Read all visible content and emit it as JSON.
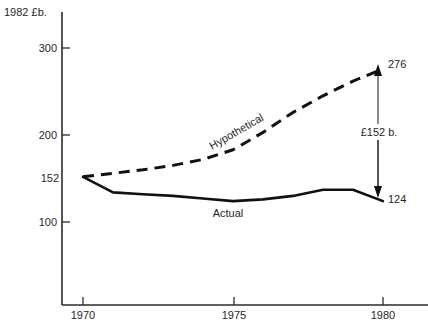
{
  "chart_data": {
    "type": "line",
    "title": "",
    "subtitle": "",
    "xlabel": "",
    "ylabel": "1982 £b.",
    "xlim": [
      1969.3,
      1981.5
    ],
    "ylim": [
      55,
      330
    ],
    "grid": false,
    "legend_position": "inline-annotation",
    "x_ticks": [
      "1970",
      "1975",
      "1980"
    ],
    "x_tick_values": [
      1970,
      1975,
      1980
    ],
    "y_ticks": [
      "100",
      "200",
      "300"
    ],
    "y_tick_values": [
      100,
      200,
      300
    ],
    "x": [
      1970,
      1971,
      1972,
      1973,
      1974,
      1975,
      1976,
      1977,
      1978,
      1979,
      1980
    ],
    "series": [
      {
        "name": "Hypothetical",
        "style": "dashed",
        "values": [
          152,
          156,
          160,
          165,
          172,
          183,
          203,
          226,
          245,
          262,
          276
        ]
      },
      {
        "name": "Actual",
        "style": "solid",
        "values": [
          152,
          134,
          132,
          130,
          127,
          124,
          126,
          130,
          137,
          137,
          124
        ]
      }
    ],
    "annotations": [
      {
        "name": "start-value",
        "text": "152",
        "x": 1970,
        "y": 152
      },
      {
        "name": "hypothetical-end-value",
        "text": "276",
        "x": 1980,
        "y": 276
      },
      {
        "name": "actual-end-value",
        "text": "124",
        "x": 1980,
        "y": 124
      },
      {
        "name": "gap-value",
        "text": "£152 b.",
        "x": 1980,
        "y": 200
      },
      {
        "name": "hypothetical-series-label",
        "text": "Hypothetical"
      },
      {
        "name": "actual-series-label",
        "text": "Actual"
      }
    ],
    "colors": {
      "line": "#111111",
      "axis": "#2b2b2b",
      "text": "#1f1f1f",
      "background": "#ffffff"
    }
  }
}
